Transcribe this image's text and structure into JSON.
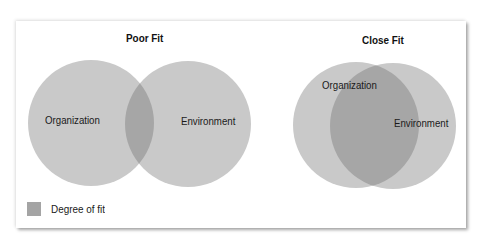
{
  "colors": {
    "circle_fill": "#c9c9c9",
    "overlap_fill": "#a6a6a6",
    "background": "#ffffff",
    "text": "#1a1a1a"
  },
  "poor_fit": {
    "title": "Poor Fit",
    "left_label": "Organization",
    "right_label": "Environment"
  },
  "close_fit": {
    "title": "Close Fit",
    "left_label": "Organization",
    "right_label": "Environment"
  },
  "legend": {
    "label": "Degree of fit",
    "icon": "gray-square-swatch"
  }
}
